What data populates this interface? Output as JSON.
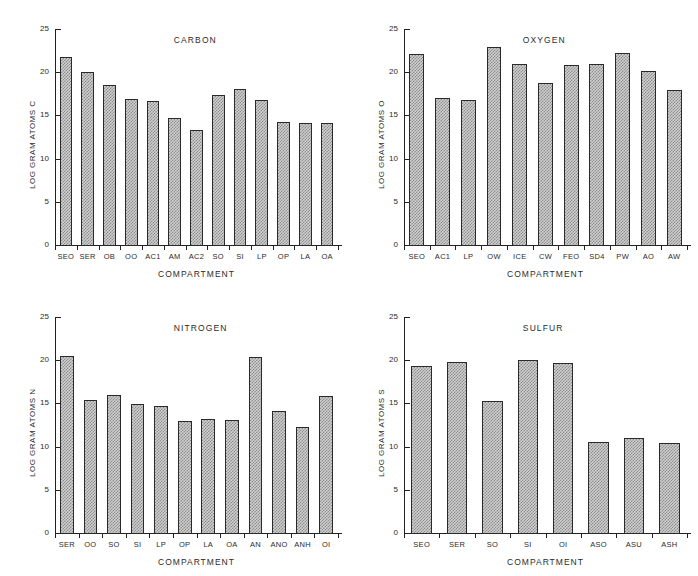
{
  "figure": {
    "background_color": "#ffffff",
    "bar_fill_color": "#cfcfcf",
    "bar_edge_color": "#2a2a2a",
    "axis_color": "#222222"
  },
  "chart_data": [
    {
      "type": "bar",
      "title": "CARBON",
      "xlabel": "COMPARTMENT",
      "ylabel": "LOG GRAM ATOMS C",
      "ylim": [
        0,
        25
      ],
      "yticks": [
        0,
        5,
        10,
        15,
        20,
        25
      ],
      "ytick_labels": [
        "0",
        "5",
        "10",
        "15",
        "20",
        "25"
      ],
      "grid": false,
      "legend": "none",
      "categories": [
        "SEO",
        "SER",
        "OB",
        "OO",
        "AC1",
        "AM",
        "AC2",
        "SO",
        "SI",
        "LP",
        "OP",
        "LA",
        "OA"
      ],
      "values": [
        21.8,
        20.0,
        18.5,
        16.9,
        16.7,
        14.7,
        13.3,
        17.4,
        18.0,
        16.8,
        14.2,
        14.1,
        14.1
      ]
    },
    {
      "type": "bar",
      "title": "OXYGEN",
      "xlabel": "COMPARTMENT",
      "ylabel": "LOG GRAM ATOMS O",
      "ylim": [
        0,
        25
      ],
      "yticks": [
        0,
        5,
        10,
        15,
        20,
        25
      ],
      "ytick_labels": [
        "0",
        "5",
        "10",
        "15",
        "20",
        "25"
      ],
      "grid": false,
      "legend": "none",
      "categories": [
        "SEO",
        "AC1",
        "LP",
        "OW",
        "ICE",
        "CW",
        "FEO",
        "SD4",
        "PW",
        "AO",
        "AW"
      ],
      "values": [
        22.1,
        17.0,
        16.8,
        22.9,
        21.0,
        18.8,
        20.8,
        20.9,
        22.2,
        20.1,
        17.9
      ]
    },
    {
      "type": "bar",
      "title": "NITROGEN",
      "xlabel": "COMPARTMENT",
      "ylabel": "LOG GRAM ATOMS N",
      "ylim": [
        0,
        25
      ],
      "yticks": [
        0,
        5,
        10,
        15,
        20,
        25
      ],
      "ytick_labels": [
        "0",
        "5",
        "10",
        "15",
        "20",
        "25"
      ],
      "grid": false,
      "legend": "none",
      "categories": [
        "SER",
        "OO",
        "SO",
        "SI",
        "LP",
        "OP",
        "LA",
        "OA",
        "AN",
        "ANO",
        "ANH",
        "OI"
      ],
      "values": [
        20.5,
        15.4,
        16.0,
        14.9,
        14.7,
        13.0,
        13.2,
        13.1,
        20.4,
        14.1,
        12.3,
        15.8
      ]
    },
    {
      "type": "bar",
      "title": "SULFUR",
      "xlabel": "COMPARTMENT",
      "ylabel": "LOG GRAM ATOMS S",
      "ylim": [
        0,
        25
      ],
      "yticks": [
        0,
        5,
        10,
        15,
        20,
        25
      ],
      "ytick_labels": [
        "0",
        "5",
        "10",
        "15",
        "20",
        "25"
      ],
      "grid": false,
      "legend": "none",
      "categories": [
        "SEO",
        "SER",
        "SO",
        "SI",
        "OI",
        "ASO",
        "ASU",
        "ASH"
      ],
      "values": [
        19.3,
        19.8,
        15.3,
        20.0,
        19.7,
        10.5,
        11.0,
        10.4
      ]
    }
  ]
}
